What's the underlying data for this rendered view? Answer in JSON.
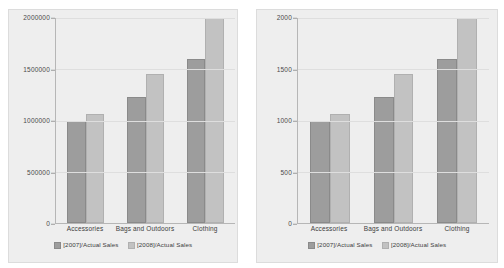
{
  "chart_data": [
    {
      "id": "left",
      "type": "bar",
      "title": "",
      "xlabel": "",
      "ylabel": "",
      "categories": [
        "Accessories",
        "Bags and Outdoors",
        "Clothing"
      ],
      "series": [
        {
          "name": "[2007]/Actual Sales",
          "color": "#9d9d9d",
          "values": [
            1000000,
            1230000,
            1600000
          ]
        },
        {
          "name": "[2008]/Actual Sales",
          "color": "#c2c2c2",
          "values": [
            1060000,
            1450000,
            2000000
          ]
        }
      ],
      "ylim": [
        0,
        2000000
      ],
      "yticks": [
        2000000,
        1500000,
        1000000,
        500000,
        0
      ],
      "ytick_labels": [
        "2000000",
        "1500000",
        "1000000",
        "500000",
        "0"
      ],
      "grid": true,
      "legend_position": "bottom"
    },
    {
      "id": "right",
      "type": "bar",
      "title": "",
      "xlabel": "",
      "ylabel": "",
      "categories": [
        "Accessories",
        "Bags and Outdoors",
        "Clothing"
      ],
      "series": [
        {
          "name": "[2007]/Actual Sales",
          "color": "#9d9d9d",
          "values": [
            1000,
            1230,
            1600
          ]
        },
        {
          "name": "[2008]/Actual Sales",
          "color": "#c2c2c2",
          "values": [
            1060,
            1450,
            2000
          ]
        }
      ],
      "ylim": [
        0,
        2000
      ],
      "yticks": [
        2000,
        1500,
        1000,
        500,
        0
      ],
      "ytick_labels": [
        "2000",
        "1500",
        "1000",
        "500",
        "0"
      ],
      "grid": true,
      "legend_position": "bottom"
    }
  ],
  "colors": {
    "series_2007": "#9d9d9d",
    "series_2008": "#c2c2c2",
    "panel_background": "#eeeeee",
    "page_background": "#ffffff",
    "gridline": "#dedede",
    "axis": "#b6b6b6"
  }
}
